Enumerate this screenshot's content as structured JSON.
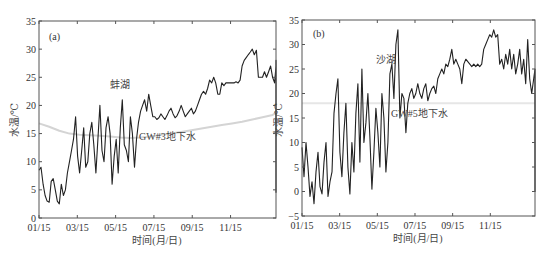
{
  "chart_data": [
    {
      "type": "line",
      "panel_label": "(a)",
      "title": "",
      "xlabel": "时间(月/日)",
      "ylabel": "水温/℃",
      "ylim": [
        0,
        35
      ],
      "yticks": [
        0,
        5,
        10,
        15,
        20,
        25,
        30,
        35
      ],
      "xticks": [
        "01/15",
        "03/15",
        "05/15",
        "07/15",
        "09/15",
        "11/15"
      ],
      "grid": false,
      "legend": "none (inline annotations)",
      "annotations": [
        {
          "text": "蚌湖",
          "near_day": 80,
          "near_value": 24.5
        },
        {
          "text": "GW#3地下水",
          "near_day": 160,
          "near_value": 14.7
        }
      ],
      "series": [
        {
          "name": "蚌湖",
          "color": "#222222",
          "day_step": 3,
          "values": [
            8.5,
            9,
            6,
            4,
            3,
            2.8,
            6.5,
            7,
            5,
            3,
            2.5,
            6,
            4,
            5,
            8,
            10,
            12,
            14,
            18,
            11,
            8,
            12,
            16,
            9,
            10,
            15,
            17,
            13,
            8,
            14,
            20,
            12,
            10,
            16,
            18,
            15,
            6,
            11,
            14,
            8,
            16,
            21,
            13,
            12,
            10,
            18,
            15,
            9,
            14,
            17,
            19,
            20,
            21,
            19,
            22,
            20,
            18,
            18,
            17.5,
            17.8,
            18.5,
            18,
            17.5,
            18.2,
            19,
            19.5,
            18.5,
            17.8,
            18.2,
            19,
            20,
            19,
            18,
            18.5,
            19,
            19.5,
            18.5,
            19,
            20,
            21,
            22,
            22.5,
            22,
            23,
            24.5,
            24,
            25,
            24,
            22,
            22,
            24,
            23.5,
            24,
            24,
            24,
            24,
            24,
            24.2,
            24,
            24.5,
            27,
            28,
            28.5,
            29,
            29.5,
            30,
            29,
            29.8,
            25,
            25,
            25,
            26,
            25,
            26,
            27,
            25,
            24,
            27,
            23,
            26,
            28,
            25,
            22,
            24,
            22,
            20,
            22,
            19,
            18,
            21,
            19,
            20,
            18,
            19,
            17,
            14,
            16,
            13,
            14,
            17,
            15,
            12,
            16,
            18,
            17,
            18,
            16,
            17,
            19,
            21,
            7,
            9,
            10,
            12,
            8,
            11,
            13,
            9,
            10,
            12,
            8,
            11,
            6,
            9,
            12,
            10,
            8,
            7,
            10,
            11,
            12,
            9,
            6,
            5,
            8,
            7,
            5,
            4.5
          ]
        },
        {
          "name": "GW#3地下水",
          "color": "#d4d4d4",
          "day_step": 15,
          "values": [
            16.8,
            16.2,
            15.5,
            15,
            14.8,
            14.7,
            14.6,
            14.5,
            14.3,
            14.2,
            14.3,
            14.5,
            14.8,
            15,
            15.3,
            15.6,
            15.9,
            16.2,
            16.5,
            16.8,
            17.1,
            17.5,
            17.9,
            18.3,
            18.8,
            19,
            19,
            18.9,
            18.8,
            18.5,
            18.3,
            17.8,
            17,
            16.5,
            15.5
          ]
        }
      ]
    },
    {
      "type": "line",
      "panel_label": "(b)",
      "title": "",
      "xlabel": "时间(月/日)",
      "ylabel": "水温/℃",
      "ylim": [
        -5,
        35
      ],
      "yticks": [
        -5,
        0,
        5,
        10,
        15,
        20,
        25,
        30,
        35
      ],
      "xticks": [
        "01/15",
        "03/15",
        "05/15",
        "07/15",
        "09/15",
        "11/15"
      ],
      "grid": false,
      "legend": "none (inline annotations)",
      "annotations": [
        {
          "text": "沙湖",
          "near_day": 120,
          "near_value": 27
        },
        {
          "text": "GW#5地下水",
          "near_day": 165,
          "near_value": 16.3
        }
      ],
      "series": [
        {
          "name": "沙湖",
          "color": "#222222",
          "day_step": 3,
          "values": [
            9,
            3,
            10,
            5,
            -1,
            2,
            -2.5,
            4,
            8,
            1,
            -0.5,
            6,
            10,
            -1,
            2,
            4,
            16,
            20,
            23,
            8,
            3,
            12,
            18,
            5,
            -0.5,
            10,
            4,
            16,
            22,
            6,
            25,
            10,
            14,
            20,
            11,
            0.5,
            8,
            17,
            12,
            5,
            20,
            15,
            4,
            10,
            24,
            26,
            19,
            30,
            33,
            15,
            20,
            19,
            12,
            18,
            20,
            21,
            19,
            20,
            22,
            20,
            19,
            21,
            22,
            18.5,
            20,
            21,
            21.5,
            20,
            23,
            24,
            25,
            24,
            26,
            25.5,
            27,
            29,
            26,
            27,
            26,
            25,
            22,
            26,
            27,
            26.5,
            26,
            25.5,
            26,
            25.5,
            26,
            25.5,
            26,
            29,
            30,
            31,
            32,
            31.5,
            33,
            31.5,
            32,
            26,
            27,
            25,
            28,
            26,
            29,
            25,
            28,
            24,
            26,
            29,
            24,
            27,
            22,
            31,
            23,
            20,
            23,
            25,
            22,
            21,
            19,
            17,
            18,
            20,
            23,
            19,
            22,
            17,
            14,
            12,
            16,
            11,
            13,
            9,
            16,
            13,
            17,
            19,
            22,
            10,
            5,
            8,
            15,
            3,
            17,
            13,
            20,
            6,
            9,
            14,
            16,
            5,
            2,
            11,
            13,
            8,
            4,
            15,
            0,
            6,
            11,
            9,
            14,
            2,
            5,
            12,
            7,
            3,
            15,
            8,
            4,
            6,
            2,
            5
          ]
        },
        {
          "name": "GW#5地下水",
          "color": "#e6e6e6",
          "day_step": 15,
          "values": [
            18,
            18,
            18,
            18,
            18,
            18,
            18,
            18,
            18,
            18,
            18,
            18,
            18,
            18,
            18,
            18,
            18,
            18,
            18,
            18,
            18,
            18,
            18,
            18,
            18,
            18,
            18,
            18,
            18,
            18,
            18,
            18,
            18,
            18,
            18
          ]
        }
      ]
    }
  ],
  "panels": {
    "a": {
      "label": "(a)",
      "ylabel": "水温/℃",
      "xlabel": "时间(月/日)",
      "lake_label": "蚌湖",
      "gw_label": "GW#3地下水"
    },
    "b": {
      "label": "(b)",
      "ylabel": "水温/℃",
      "xlabel": "时间(月/日)",
      "lake_label": "沙湖",
      "gw_label": "GW#5地下水"
    }
  }
}
